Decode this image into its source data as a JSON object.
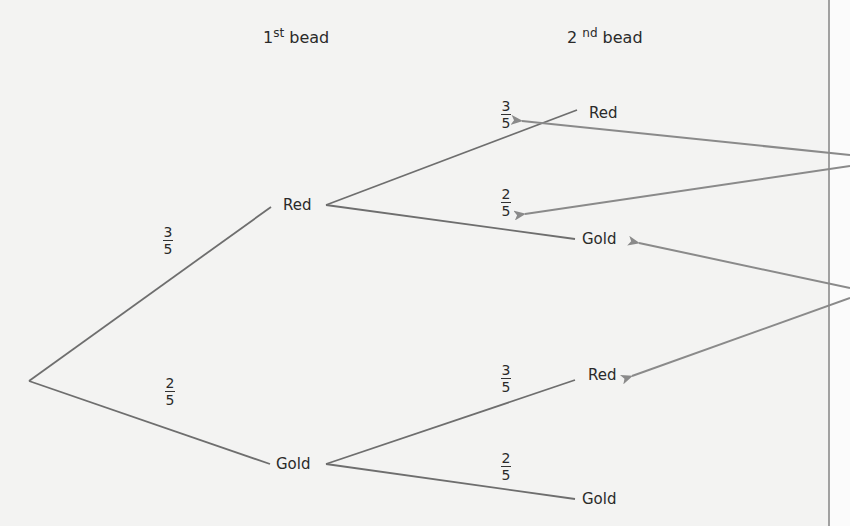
{
  "headers": {
    "first": {
      "base": "1",
      "sup": "st",
      "text": "bead"
    },
    "second": {
      "base": "2",
      "sup": "nd",
      "text": "bead"
    }
  },
  "colors": {
    "branch": "#6e6e6e",
    "arrow": "#8a8a8a",
    "divider": "#6a6a6a",
    "background": "#f3f3f2"
  },
  "tree": {
    "root": {
      "x": 29,
      "y": 381
    },
    "first_level": [
      {
        "label": "Red",
        "probability": {
          "num": "3",
          "den": "5"
        }
      },
      {
        "label": "Gold",
        "probability": {
          "num": "2",
          "den": "5"
        }
      }
    ],
    "second_level": [
      {
        "parent": "Red",
        "label": "Red",
        "probability": {
          "num": "3",
          "den": "5"
        }
      },
      {
        "parent": "Red",
        "label": "Gold",
        "probability": {
          "num": "2",
          "den": "5"
        }
      },
      {
        "parent": "Gold",
        "label": "Red",
        "probability": {
          "num": "3",
          "den": "5"
        }
      },
      {
        "parent": "Gold",
        "label": "Gold",
        "probability": {
          "num": "2",
          "den": "5"
        }
      }
    ]
  },
  "annotations": {
    "arrows": [
      {
        "from": "right-margin",
        "to": "prob-red-red"
      },
      {
        "from": "right-margin",
        "to": "prob-red-gold"
      },
      {
        "from": "right-margin",
        "to": "node-red-gold"
      },
      {
        "from": "right-margin",
        "to": "node-gold-red"
      }
    ]
  }
}
